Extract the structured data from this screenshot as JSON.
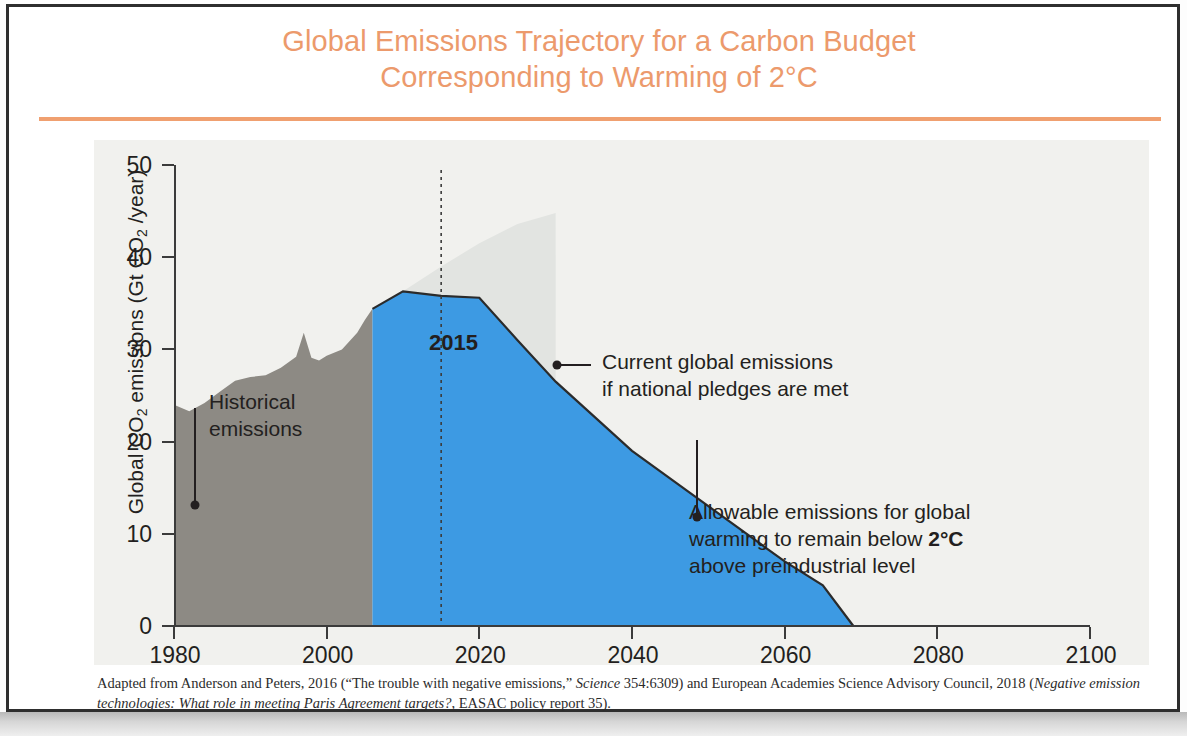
{
  "title": {
    "line1": "Global Emissions Trajectory for a Carbon Budget",
    "line2": "Corresponding to Warming of 2°C",
    "color": "#ec9a6c"
  },
  "annotations": {
    "historical": "Historical\nemissions",
    "pledges": "Current global emissions\nif national pledges are met",
    "allowable_pre": "Allowable emissions for global\nwarming to remain below ",
    "allowable_bold": "2°C",
    "allowable_post": "\nabove preindustrial level",
    "year_marker": "2015"
  },
  "caption": {
    "part1": "Adapted from Anderson and Peters, 2016 (“The trouble with negative emissions,” ",
    "italic1": "Science",
    "part2": " 354:6309) and European Academies Science Advisory Council, 2018 (",
    "italic2": "Negative emission technologies: What role in meeting Paris Agreement targets?",
    "part3": ", EASAC policy report 35)."
  },
  "chart_data": {
    "type": "area",
    "title": "Global Emissions Trajectory for a Carbon Budget Corresponding to Warming of 2°C",
    "xlabel": "",
    "ylabel": "Global CO2 emissions (Gt CO2 /year)",
    "xlim": [
      1980,
      2100
    ],
    "ylim": [
      0,
      50
    ],
    "xticks": [
      1980,
      2000,
      2020,
      2040,
      2060,
      2080,
      2100
    ],
    "yticks": [
      0,
      10,
      20,
      30,
      40,
      50
    ],
    "grid": false,
    "legend": "none",
    "colors": {
      "historical": "#8d8a84",
      "allowable": "#3d9ae3",
      "pledges": "#e2e4e1",
      "outline": "#2b2b2b",
      "panel_background": "#f1f1ee"
    },
    "marker_year": 2015,
    "series": [
      {
        "name": "Historical emissions",
        "color": "#8d8a84",
        "x": [
          1980,
          1982,
          1984,
          1986,
          1988,
          1990,
          1992,
          1994,
          1996,
          1997,
          1998,
          1999,
          2000,
          2002,
          2004,
          2005,
          2006
        ],
        "values": [
          24.0,
          23.3,
          24.2,
          25.4,
          26.6,
          27.0,
          27.2,
          28.0,
          29.2,
          31.8,
          29.1,
          28.8,
          29.3,
          30.0,
          31.8,
          33.2,
          34.4
        ]
      },
      {
        "name": "Current global emissions if national pledges are met",
        "color": "#e2e4e1",
        "x": [
          2006,
          2010,
          2015,
          2020,
          2025,
          2030
        ],
        "values": [
          34.4,
          36.3,
          39.0,
          41.5,
          43.6,
          44.8
        ]
      },
      {
        "name": "Allowable emissions for global warming to remain below 2°C above preindustrial level",
        "color": "#3d9ae3",
        "x": [
          2006,
          2010,
          2015,
          2020,
          2025,
          2030,
          2040,
          2050,
          2060,
          2065,
          2069
        ],
        "values": [
          34.4,
          36.3,
          35.8,
          35.6,
          31.0,
          26.5,
          19.0,
          13.0,
          7.0,
          4.4,
          0.0
        ]
      }
    ]
  }
}
